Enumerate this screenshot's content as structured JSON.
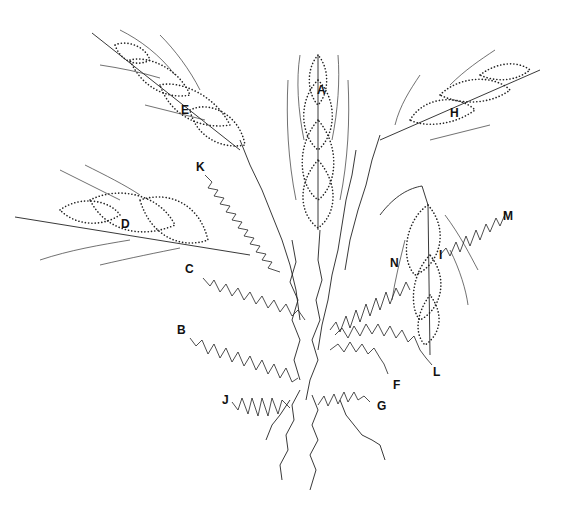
{
  "figure": {
    "labels": [
      {
        "id": "A",
        "x": 317,
        "y": 84
      },
      {
        "id": "B",
        "x": 177,
        "y": 324
      },
      {
        "id": "C",
        "x": 185,
        "y": 263
      },
      {
        "id": "D",
        "x": 121,
        "y": 218
      },
      {
        "id": "E",
        "x": 181,
        "y": 104
      },
      {
        "id": "F",
        "x": 393,
        "y": 379
      },
      {
        "id": "G",
        "x": 377,
        "y": 400
      },
      {
        "id": "H",
        "x": 450,
        "y": 107
      },
      {
        "id": "I",
        "x": 439,
        "y": 249
      },
      {
        "id": "J",
        "x": 222,
        "y": 394
      },
      {
        "id": "K",
        "x": 196,
        "y": 161
      },
      {
        "id": "L",
        "x": 433,
        "y": 366
      },
      {
        "id": "M",
        "x": 503,
        "y": 210
      },
      {
        "id": "N",
        "x": 390,
        "y": 257
      }
    ]
  }
}
